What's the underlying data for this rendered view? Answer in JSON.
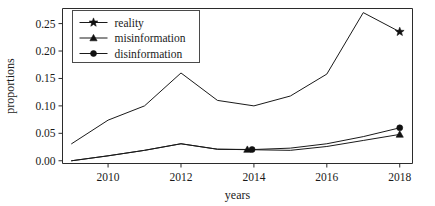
{
  "chart_data": {
    "type": "line",
    "title": "",
    "xlabel": "years",
    "ylabel": "proportions",
    "xlim": [
      2008.75,
      2018.35
    ],
    "ylim": [
      -0.005,
      0.2775
    ],
    "grid": false,
    "legend_position": "upper-left",
    "x": [
      2009,
      2010,
      2011,
      2012,
      2013,
      2014,
      2015,
      2016,
      2017,
      2018
    ],
    "xticks": [
      2010,
      2012,
      2014,
      2016,
      2018
    ],
    "xtick_labels": [
      "2010",
      "2012",
      "2014",
      "2016",
      "2018"
    ],
    "yticks": [
      0.0,
      0.05,
      0.1,
      0.15,
      0.2,
      0.25
    ],
    "ytick_labels": [
      "0.00",
      "0.05",
      "0.10",
      "0.15",
      "0.20",
      "0.25"
    ],
    "series": [
      {
        "name": "reality",
        "marker": "star",
        "values": [
          0.031,
          0.074,
          0.1,
          0.16,
          0.11,
          0.1,
          0.118,
          0.158,
          0.27,
          0.235
        ],
        "marker_points": [
          {
            "x": 2018,
            "y": 0.235
          }
        ]
      },
      {
        "name": "misinformation",
        "marker": "triangle",
        "values": [
          0.0,
          0.009,
          0.019,
          0.031,
          0.021,
          0.02,
          0.019,
          0.026,
          0.037,
          0.048
        ],
        "marker_points": [
          {
            "x": 2013.82,
            "y": 0.0205
          },
          {
            "x": 2018,
            "y": 0.048
          }
        ]
      },
      {
        "name": "disinformation",
        "marker": "circle",
        "values": [
          0.0,
          0.009,
          0.019,
          0.031,
          0.021,
          0.0205,
          0.023,
          0.031,
          0.044,
          0.06
        ],
        "marker_points": [
          {
            "x": 2013.95,
            "y": 0.0205
          },
          {
            "x": 2018,
            "y": 0.06
          }
        ]
      }
    ]
  },
  "legend": {
    "entries": [
      {
        "label": "reality",
        "marker": "star"
      },
      {
        "label": "misinformation",
        "marker": "triangle"
      },
      {
        "label": "disinformation",
        "marker": "circle"
      }
    ]
  },
  "colors": {
    "line": "#1a1a1a",
    "axis": "#2b2b2b",
    "background": "#ffffff"
  }
}
